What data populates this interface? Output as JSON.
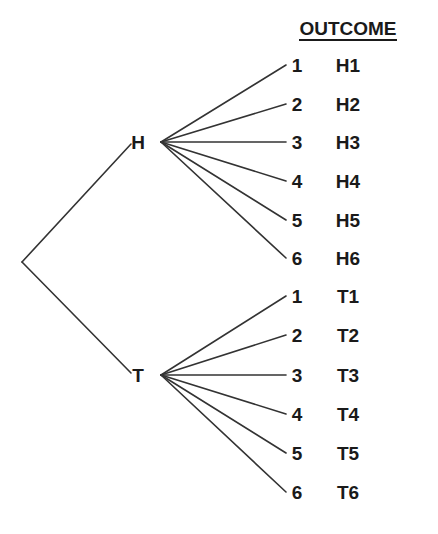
{
  "diagram": {
    "type": "tree-diagram",
    "line_color": "#333333",
    "text_color": "#1a1a1a",
    "background_color": "#ffffff",
    "header": {
      "outcome_label": "OUTCOME"
    },
    "root": {
      "x": 22,
      "y": 262
    },
    "branches": [
      {
        "node_label": "H",
        "node_x": 138,
        "node_y": 142,
        "fan_origin_x": 161,
        "fan_origin_y": 142,
        "leaves": [
          {
            "die": "1",
            "outcome": "H1",
            "y": 65
          },
          {
            "die": "2",
            "outcome": "H2",
            "y": 104
          },
          {
            "die": "3",
            "outcome": "H3",
            "y": 142
          },
          {
            "die": "4",
            "outcome": "H4",
            "y": 181
          },
          {
            "die": "5",
            "outcome": "H5",
            "y": 220
          },
          {
            "die": "6",
            "outcome": "H6",
            "y": 258
          }
        ]
      },
      {
        "node_label": "T",
        "node_x": 138,
        "node_y": 375,
        "fan_origin_x": 161,
        "fan_origin_y": 375,
        "leaves": [
          {
            "die": "1",
            "outcome": "T1",
            "y": 296
          },
          {
            "die": "2",
            "outcome": "T2",
            "y": 335,
            "comment": ""
          },
          {
            "die": "3",
            "outcome": "T3",
            "y": 375
          },
          {
            "die": "4",
            "outcome": "T4",
            "y": 414
          },
          {
            "die": "5",
            "outcome": "T5",
            "y": 453
          },
          {
            "die": "6",
            "outcome": "T6",
            "y": 492
          }
        ]
      }
    ],
    "geometry": {
      "die_label_x": 297,
      "outcome_label_x": 348,
      "fan_end_x": 286,
      "header_x": 348,
      "header_y": 30
    }
  }
}
